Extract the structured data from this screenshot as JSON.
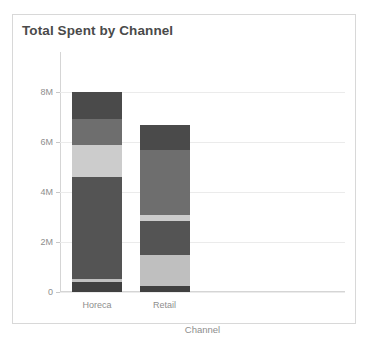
{
  "card": {
    "title": "Total Spent by Channel",
    "border_color": "#d8d8d8",
    "background": "#ffffff"
  },
  "chart_data": {
    "type": "bar",
    "subtype": "stacked-bar",
    "title": "Total Spent by Channel",
    "xlabel": "Channel",
    "ylabel": "",
    "categories": [
      "Horeca",
      "Retail"
    ],
    "ytick_labels": [
      "8M",
      "6M",
      "4M",
      "2M",
      "0"
    ],
    "ytick_values": [
      8000000,
      6000000,
      4000000,
      2000000,
      0
    ],
    "ylim": [
      0,
      9600000
    ],
    "grid": true,
    "legend": false,
    "legend_position": "none",
    "series": [
      {
        "name": "Segment 1",
        "color": "#404040",
        "values": [
          400000,
          230000
        ]
      },
      {
        "name": "Segment 2",
        "color": "#bfbfbf",
        "values": [
          130000,
          1270000
        ]
      },
      {
        "name": "Segment 3",
        "color": "#545454",
        "values": [
          4070000,
          1330000
        ]
      },
      {
        "name": "Segment 4",
        "color": "#cccccc",
        "values": [
          1270000,
          240000
        ]
      },
      {
        "name": "Segment 5",
        "color": "#6e6e6e",
        "values": [
          1070000,
          2600000
        ]
      },
      {
        "name": "Segment 6",
        "color": "#4a4a4a",
        "values": [
          1060000,
          1000000
        ]
      }
    ],
    "totals": [
      8000000,
      6670000
    ]
  },
  "colors": {
    "title_text": "#4a4a4a",
    "tick_text": "#8e8e8e",
    "gridline": "#ebebeb",
    "axis_line": "#d5d5d5"
  }
}
